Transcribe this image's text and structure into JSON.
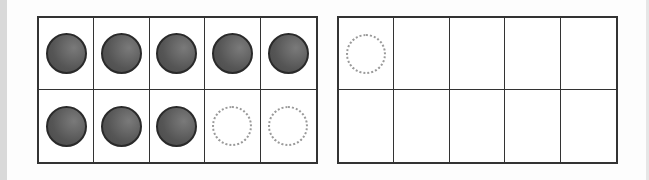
{
  "ten_frames": [
    {
      "name": "ten-frame-left",
      "cells": [
        "filled",
        "filled",
        "filled",
        "filled",
        "filled",
        "filled",
        "filled",
        "filled",
        "dotted",
        "dotted"
      ]
    },
    {
      "name": "ten-frame-right",
      "cells": [
        "dotted",
        "blank",
        "blank",
        "blank",
        "blank",
        "blank",
        "blank",
        "blank",
        "blank",
        "blank"
      ]
    }
  ],
  "counts": {
    "filled": 8,
    "dotted": 3
  },
  "colors": {
    "counter": "#555555",
    "border": "#333333",
    "dotted": "#9a9a9a"
  }
}
